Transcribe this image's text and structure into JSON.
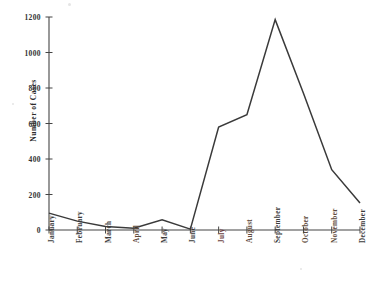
{
  "chart_data": {
    "type": "line",
    "title": "",
    "xlabel": "",
    "ylabel": "Number of Cases",
    "categories": [
      "January",
      "February",
      "March",
      "April",
      "May",
      "June",
      "July",
      "August",
      "September",
      "October",
      "November",
      "December"
    ],
    "values": [
      95,
      50,
      20,
      10,
      58,
      5,
      580,
      650,
      1185,
      770,
      340,
      152
    ],
    "series": [
      {
        "name": "Number of Cases",
        "values": [
          95,
          50,
          20,
          10,
          58,
          5,
          580,
          650,
          1185,
          770,
          340,
          152
        ]
      }
    ],
    "ylim": [
      0,
      1200
    ],
    "yticks": [
      0,
      200,
      400,
      600,
      800,
      1000,
      1200
    ],
    "ytick_labels": [
      "0",
      "200",
      "400",
      "600",
      "800",
      "1000",
      "1200"
    ],
    "grid": false,
    "legend": false,
    "legend_position": "none",
    "line_color": "#3a3a3a",
    "background_color": "#ffffff",
    "axis_color": "#444444"
  },
  "axis": {
    "y_title": "Number of Cases"
  }
}
